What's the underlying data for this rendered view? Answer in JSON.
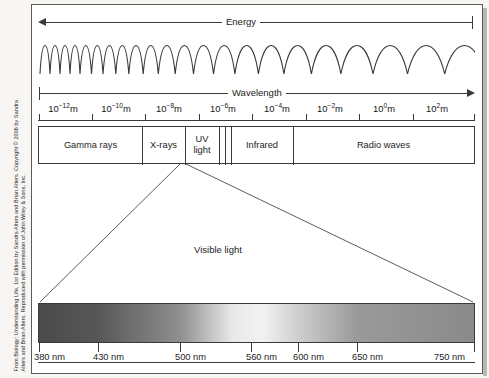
{
  "figure": {
    "credit_line_1": "From Biology: Understanding Life, 1st Edition by Sandra Alters and Brian Alters. Copyright © 2006 by Sandra",
    "credit_line_2": "Alters and Brian Alters. Reproduced with permission of John Wiley & Sons, Inc."
  },
  "energy_axis": {
    "label": "Energy",
    "direction": "left"
  },
  "wavelength_axis": {
    "label": "Wavelength",
    "direction": "right",
    "unit": "m",
    "ticks": [
      {
        "mantissa": "10",
        "exponent": "−12",
        "unit": "m"
      },
      {
        "mantissa": "10",
        "exponent": "−10",
        "unit": "m"
      },
      {
        "mantissa": "10",
        "exponent": "−8",
        "unit": "m"
      },
      {
        "mantissa": "10",
        "exponent": "−6",
        "unit": "m"
      },
      {
        "mantissa": "10",
        "exponent": "−4",
        "unit": "m"
      },
      {
        "mantissa": "10",
        "exponent": "−2",
        "unit": "m"
      },
      {
        "mantissa": "10",
        "exponent": "0",
        "unit": "m"
      },
      {
        "mantissa": "10",
        "exponent": "2",
        "unit": "m"
      }
    ]
  },
  "bands": [
    {
      "label": "Gamma rays"
    },
    {
      "label": "X-rays"
    },
    {
      "label": "UV light"
    },
    {
      "label": ""
    },
    {
      "label": "Infrared"
    },
    {
      "label": "Radio waves"
    }
  ],
  "visible": {
    "label": "Visible light",
    "ticks": [
      {
        "label": "380 nm"
      },
      {
        "label": "430 nm"
      },
      {
        "label": "500 nm"
      },
      {
        "label": "560 nm"
      },
      {
        "label": "600 nm"
      },
      {
        "label": "650 nm"
      },
      {
        "label": "750 nm"
      }
    ]
  },
  "chart_data": {
    "type": "bar",
    "xlabel": "Wavelength",
    "ylabel": "",
    "x_scale": "log10",
    "x_unit": "m",
    "xlim": [
      -13,
      3
    ],
    "axis_tick_exponents": [
      -12,
      -10,
      -8,
      -6,
      -4,
      -2,
      0,
      2
    ],
    "axis_tick_labels": [
      "10⁻¹²m",
      "10⁻¹⁰m",
      "10⁻⁸m",
      "10⁻⁶m",
      "10⁻⁴m",
      "10⁻²m",
      "10⁰m",
      "10²m"
    ],
    "secondary_axis": {
      "label": "Energy",
      "direction": "increases to the left"
    },
    "categories": [
      "Gamma rays",
      "X-rays",
      "UV light",
      "Visible light",
      "Infrared",
      "Radio waves"
    ],
    "band_extents_exponent": [
      {
        "name": "Gamma rays",
        "start": -13.0,
        "end": -9.1
      },
      {
        "name": "X-rays",
        "start": -9.1,
        "end": -7.4
      },
      {
        "name": "UV light",
        "start": -7.4,
        "end": -6.3
      },
      {
        "name": "Visible light",
        "start": -6.3,
        "end": -5.9
      },
      {
        "name": "Infrared",
        "start": -5.9,
        "end": -3.9
      },
      {
        "name": "Radio waves",
        "start": -3.9,
        "end": 3.0
      }
    ],
    "visible_detail": {
      "type": "gradient",
      "xlabel": "Wavelength (nm)",
      "xlim": [
        380,
        750
      ],
      "tick_values": [
        380,
        430,
        500,
        560,
        600,
        650,
        750
      ],
      "tick_labels": [
        "380 nm",
        "430 nm",
        "500 nm",
        "560 nm",
        "600 nm",
        "650 nm",
        "750 nm"
      ],
      "rendering": "grayscale reproduction of violet-to-red color ramp",
      "gray_stops": [
        {
          "nm": 380,
          "gray": "#4a4a4a"
        },
        {
          "nm": 430,
          "gray": "#575757"
        },
        {
          "nm": 500,
          "gray": "#8f8f8f"
        },
        {
          "nm": 545,
          "gray": "#e9e9e9"
        },
        {
          "nm": 570,
          "gray": "#f2f2f2"
        },
        {
          "nm": 600,
          "gray": "#cfcfcf"
        },
        {
          "nm": 650,
          "gray": "#9a9a9a"
        },
        {
          "nm": 750,
          "gray": "#8a8a8a"
        }
      ]
    },
    "wave_illustration": {
      "description": "sinusoid with wavelength increasing left to right",
      "cycles": 17
    }
  },
  "colors": {
    "ink": "#3a3a3a",
    "text": "#1d1d1d",
    "paper": "#ffffff",
    "scan_bg": "#f7f6f3"
  }
}
